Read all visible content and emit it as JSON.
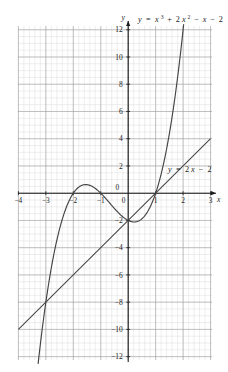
{
  "figure": {
    "background": "#ffffff",
    "grid_color_minor": "#d8d8d8",
    "grid_color_major": "#9a9a9a",
    "axis_color": "#1c1c1c",
    "curve_color": "#444444",
    "line_color": "#444444"
  },
  "labels": {
    "x_axis_name": "x",
    "y_axis_name": "y",
    "cubic_equation_plain": "y = x³ + 2x² − x − 2",
    "cubic_eq_parts": {
      "lhs": "y",
      "eq": "=",
      "t1_base": "x",
      "t1_exp": "3",
      "op1": "+",
      "t2_coef": "2",
      "t2_base": "x",
      "t2_exp": "2",
      "op2": "−",
      "t3": "x",
      "op3": "−",
      "t4": "2"
    },
    "line_equation_plain": "y = 2x − 2",
    "line_eq_parts": {
      "lhs": "y",
      "eq": "=",
      "coef": "2",
      "var": "x",
      "op": "−",
      "constant": "2"
    }
  },
  "chart_data": {
    "type": "line",
    "title": "",
    "xlabel": "x",
    "ylabel": "y",
    "xlim": [
      -4,
      3
    ],
    "ylim": [
      -12,
      12
    ],
    "xticks": [
      -4,
      -3,
      -2,
      -1,
      0,
      1,
      2,
      3
    ],
    "xtick_labels": [
      "−4",
      "−3",
      "−2",
      "−1",
      "0",
      "1",
      "2",
      "3"
    ],
    "yticks": [
      -12,
      -10,
      -8,
      -6,
      -4,
      -2,
      0,
      2,
      4,
      6,
      8,
      10,
      12
    ],
    "ytick_labels": [
      "−12",
      "−10",
      "−8",
      "−6",
      "−4",
      "−2",
      "0",
      "2",
      "4",
      "6",
      "8",
      "10",
      "12"
    ],
    "grid": true,
    "grid_minor_x_step": 0.2,
    "grid_minor_y_step": 0.5,
    "grid_major_x_step": 1,
    "grid_major_y_step": 2,
    "legend": "none",
    "series": [
      {
        "name": "y = x³ + 2x² − x − 2",
        "type": "cubic",
        "equation": "y = x^3 + 2x^2 - x - 2",
        "coefficients": {
          "x3": 1,
          "x2": 2,
          "x1": -1,
          "x0": -2
        },
        "roots": [
          -2,
          -1,
          1
        ],
        "y_intercept": -2,
        "local_max": {
          "x": -1.549,
          "y": 0.631
        },
        "local_min": {
          "x": 0.215,
          "y": -2.113
        },
        "label_position": {
          "x": 0.05,
          "y": 12.6
        },
        "points": [
          {
            "x": -3.4,
            "y": -14.8
          },
          {
            "x": -3.2,
            "y": -11.1
          },
          {
            "x": -3.0,
            "y": -8.0
          },
          {
            "x": -2.8,
            "y": -5.5
          },
          {
            "x": -2.6,
            "y": -3.5
          },
          {
            "x": -2.4,
            "y": -1.9
          },
          {
            "x": -2.2,
            "y": -0.8
          },
          {
            "x": -2.0,
            "y": 0.0
          },
          {
            "x": -1.8,
            "y": 0.45
          },
          {
            "x": -1.6,
            "y": 0.62
          },
          {
            "x": -1.4,
            "y": 0.58
          },
          {
            "x": -1.2,
            "y": 0.35
          },
          {
            "x": -1.0,
            "y": 0.0
          },
          {
            "x": -0.8,
            "y": -0.43
          },
          {
            "x": -0.6,
            "y": -0.9
          },
          {
            "x": -0.4,
            "y": -1.34
          },
          {
            "x": -0.2,
            "y": -1.73
          },
          {
            "x": 0.0,
            "y": -2.0
          },
          {
            "x": 0.2,
            "y": -2.11
          },
          {
            "x": 0.4,
            "y": -2.02
          },
          {
            "x": 0.6,
            "y": -1.66
          },
          {
            "x": 0.8,
            "y": -0.99
          },
          {
            "x": 1.0,
            "y": 0.0
          },
          {
            "x": 1.2,
            "y": 1.41
          },
          {
            "x": 1.4,
            "y": 3.26
          },
          {
            "x": 1.6,
            "y": 5.62
          },
          {
            "x": 1.8,
            "y": 8.51
          },
          {
            "x": 2.0,
            "y": 12.0
          }
        ]
      },
      {
        "name": "y = 2x − 2",
        "type": "linear",
        "equation": "y = 2x - 2",
        "slope": 2,
        "intercept": -2,
        "x_root": 1,
        "label_position": {
          "x": 1.45,
          "y": 2.6
        },
        "points": [
          {
            "x": -4,
            "y": -10
          },
          {
            "x": 3,
            "y": 4
          }
        ]
      }
    ],
    "intersections": [
      {
        "x": -2,
        "y": -6
      },
      {
        "x": 0,
        "y": -2
      },
      {
        "x": 1,
        "y": 0
      }
    ]
  }
}
